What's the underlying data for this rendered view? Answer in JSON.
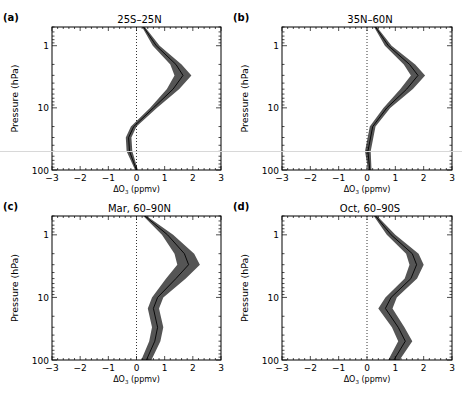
{
  "figure": {
    "ylabel": "Pressure (hPa)",
    "xlabel_main": "ΔO",
    "xlabel_sub": "3",
    "xlabel_unit": " (ppmv)",
    "colors": {
      "band": "#555555",
      "line": "#000000",
      "frame": "#000000",
      "zero_line": "#000000"
    }
  },
  "chart_data": [
    {
      "type": "line",
      "panel": "(a)",
      "title": "25S–25N",
      "xlabel": "ΔO3 (ppmv)",
      "ylabel": "Pressure (hPa)",
      "xlim": [
        -3,
        3
      ],
      "ylim": [
        100,
        0.5
      ],
      "yscale": "log",
      "xticks": [
        -3,
        -2,
        -1,
        0,
        1,
        2,
        3
      ],
      "yticks": [
        1,
        10,
        100
      ],
      "pressure": [
        0.5,
        1,
        2,
        3,
        5,
        10,
        20,
        30,
        50,
        100
      ],
      "mean": [
        0.25,
        0.7,
        1.4,
        1.65,
        1.3,
        0.6,
        -0.1,
        -0.28,
        -0.25,
        0.0
      ],
      "halfwidth": [
        0.05,
        0.12,
        0.2,
        0.3,
        0.22,
        0.12,
        0.1,
        0.1,
        0.1,
        0.05
      ]
    },
    {
      "type": "line",
      "panel": "(b)",
      "title": "35N–60N",
      "xlabel": "ΔO3 (ppmv)",
      "ylabel": "Pressure (hPa)",
      "xlim": [
        -3,
        3
      ],
      "ylim": [
        100,
        0.5
      ],
      "yscale": "log",
      "xticks": [
        -3,
        -2,
        -1,
        0,
        1,
        2,
        3
      ],
      "yticks": [
        1,
        10,
        100
      ],
      "pressure": [
        0.5,
        1,
        2,
        3,
        5,
        10,
        20,
        50,
        100
      ],
      "mean": [
        0.3,
        0.75,
        1.5,
        1.8,
        1.4,
        0.7,
        0.2,
        0.03,
        0.1
      ],
      "halfwidth": [
        0.05,
        0.12,
        0.2,
        0.25,
        0.22,
        0.12,
        0.1,
        0.1,
        0.06
      ]
    },
    {
      "type": "line",
      "panel": "(c)",
      "title": "Mar, 60–90N",
      "xlabel": "ΔO3 (ppmv)",
      "ylabel": "Pressure (hPa)",
      "xlim": [
        -3,
        3
      ],
      "ylim": [
        100,
        0.5
      ],
      "yscale": "log",
      "xticks": [
        -3,
        -2,
        -1,
        0,
        1,
        2,
        3
      ],
      "yticks": [
        1,
        10,
        100
      ],
      "pressure": [
        0.5,
        1,
        2,
        3,
        5,
        10,
        15,
        30,
        50,
        100
      ],
      "mean": [
        0.3,
        1.1,
        1.7,
        1.85,
        1.4,
        0.75,
        0.6,
        0.75,
        0.65,
        0.35
      ],
      "halfwidth": [
        0.06,
        0.2,
        0.35,
        0.4,
        0.35,
        0.2,
        0.2,
        0.2,
        0.2,
        0.18
      ]
    },
    {
      "type": "line",
      "panel": "(d)",
      "title": "Oct, 60–90S",
      "xlabel": "ΔO3 (ppmv)",
      "ylabel": "Pressure (hPa)",
      "xlim": [
        -3,
        3
      ],
      "ylim": [
        100,
        0.5
      ],
      "yscale": "log",
      "xticks": [
        -3,
        -2,
        -1,
        0,
        1,
        2,
        3
      ],
      "yticks": [
        1,
        10,
        100
      ],
      "pressure": [
        0.5,
        1,
        2,
        3,
        5,
        10,
        15,
        30,
        50,
        100
      ],
      "mean": [
        0.3,
        0.85,
        1.6,
        1.75,
        1.55,
        0.85,
        0.65,
        1.1,
        1.35,
        0.95
      ],
      "halfwidth": [
        0.06,
        0.15,
        0.22,
        0.25,
        0.22,
        0.2,
        0.25,
        0.22,
        0.25,
        0.2
      ]
    }
  ]
}
